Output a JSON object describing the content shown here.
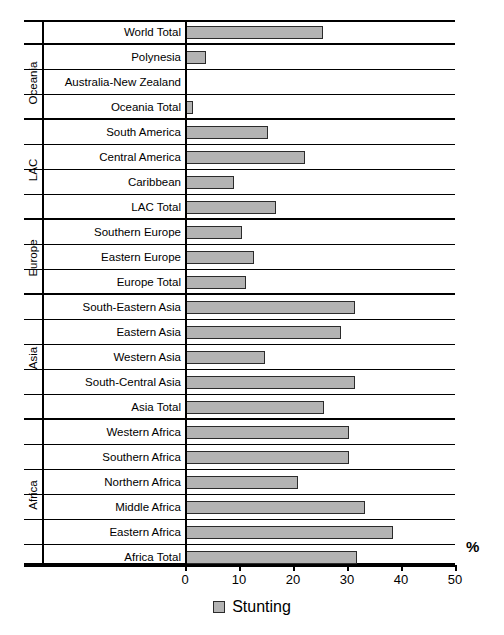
{
  "chart_data": {
    "type": "bar",
    "orientation": "horizontal",
    "title": "",
    "xlabel": "%",
    "ylabel": "",
    "xlim": [
      0,
      50
    ],
    "xticks": [
      0,
      10,
      20,
      30,
      40,
      50
    ],
    "grid": false,
    "legend": {
      "position": "bottom-center",
      "entries": [
        {
          "label": "Stunting",
          "color": "#b3b3b3"
        }
      ]
    },
    "axis_unit_label": "%",
    "series": [
      {
        "name": "Stunting",
        "color": "#b3b3b3",
        "values": [
          25.5,
          3.9,
          null,
          1.5,
          15.4,
          22.3,
          9.1,
          16.8,
          10.6,
          12.7,
          11.3,
          31.5,
          28.9,
          14.9,
          31.5,
          25.8,
          30.4,
          30.4,
          21.0,
          33.3,
          38.6,
          31.9
        ]
      }
    ],
    "categories": [
      "World Total",
      "Polynesia",
      "Australia-New  Zealand",
      "Oceania Total",
      "South America",
      "Central America",
      "Caribbean",
      "LAC Total",
      "Southern Europe",
      "Eastern Europe",
      "Europe Total",
      "South-Eastern Asia",
      "Eastern Asia",
      "Western Asia",
      "South-Central Asia",
      "Asia Total",
      "Western Africa",
      "Southern Africa",
      "Northern Africa",
      "Middle Africa",
      "Eastern Africa",
      "Africa Total"
    ],
    "groups": [
      {
        "label": "",
        "start": 0,
        "count": 1
      },
      {
        "label": "Oceania",
        "start": 1,
        "count": 3
      },
      {
        "label": "LAC",
        "start": 4,
        "count": 4
      },
      {
        "label": "Europe",
        "start": 8,
        "count": 3
      },
      {
        "label": "Asia",
        "start": 11,
        "count": 5
      },
      {
        "label": "Africa",
        "start": 16,
        "count": 6
      }
    ],
    "rows": [
      {
        "label": "World Total",
        "value": 25.5,
        "group": "",
        "group_end": true
      },
      {
        "label": "Polynesia",
        "value": 3.9,
        "group": "Oceania",
        "group_end": false
      },
      {
        "label": "Australia-New  Zealand",
        "value": null,
        "group": "Oceania",
        "group_end": false
      },
      {
        "label": "Oceania Total",
        "value": 1.5,
        "group": "Oceania",
        "group_end": true
      },
      {
        "label": "South America",
        "value": 15.4,
        "group": "LAC",
        "group_end": false
      },
      {
        "label": "Central America",
        "value": 22.3,
        "group": "LAC",
        "group_end": false
      },
      {
        "label": "Caribbean",
        "value": 9.1,
        "group": "LAC",
        "group_end": false
      },
      {
        "label": "LAC Total",
        "value": 16.8,
        "group": "LAC",
        "group_end": true
      },
      {
        "label": "Southern Europe",
        "value": 10.6,
        "group": "Europe",
        "group_end": false
      },
      {
        "label": "Eastern Europe",
        "value": 12.7,
        "group": "Europe",
        "group_end": false
      },
      {
        "label": "Europe Total",
        "value": 11.3,
        "group": "Europe",
        "group_end": true
      },
      {
        "label": "South-Eastern Asia",
        "value": 31.5,
        "group": "Asia",
        "group_end": false
      },
      {
        "label": "Eastern Asia",
        "value": 28.9,
        "group": "Asia",
        "group_end": false
      },
      {
        "label": "Western Asia",
        "value": 14.9,
        "group": "Asia",
        "group_end": false
      },
      {
        "label": "South-Central Asia",
        "value": 31.5,
        "group": "Asia",
        "group_end": false
      },
      {
        "label": "Asia Total",
        "value": 25.8,
        "group": "Asia",
        "group_end": true
      },
      {
        "label": "Western Africa",
        "value": 30.4,
        "group": "Africa",
        "group_end": false
      },
      {
        "label": "Southern Africa",
        "value": 30.4,
        "group": "Africa",
        "group_end": false
      },
      {
        "label": "Northern Africa",
        "value": 21.0,
        "group": "Africa",
        "group_end": false
      },
      {
        "label": "Middle Africa",
        "value": 33.3,
        "group": "Africa",
        "group_end": false
      },
      {
        "label": "Eastern Africa",
        "value": 38.6,
        "group": "Africa",
        "group_end": false
      },
      {
        "label": "Africa Total",
        "value": 31.9,
        "group": "Africa",
        "group_end": true
      }
    ]
  }
}
